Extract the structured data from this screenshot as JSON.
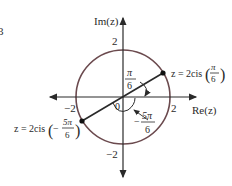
{
  "diagram": {
    "type": "complex-plane",
    "axes": {
      "imaginary_label": "Im(z)",
      "real_label": "Re(z)",
      "ticks": {
        "top": "2",
        "bottom": "−2",
        "left": "−2",
        "right": "2"
      }
    },
    "circle": {
      "radius": 2,
      "color": "#6b4a4e"
    },
    "points": [
      {
        "name": "z1",
        "label_prefix": "z = 2cis",
        "sign": "",
        "num": "π",
        "den": "6",
        "angle": "π/6"
      },
      {
        "name": "z2",
        "label_prefix": "z = 2cis",
        "sign": "−",
        "num": "5π",
        "den": "6",
        "angle": "−5π/6"
      }
    ],
    "angles": [
      {
        "label_num": "π",
        "label_den": "6",
        "sign": ""
      },
      {
        "label_num": "5π",
        "label_den": "6",
        "sign": "−"
      }
    ],
    "origin_label": "0",
    "edge_fragment": "3"
  }
}
